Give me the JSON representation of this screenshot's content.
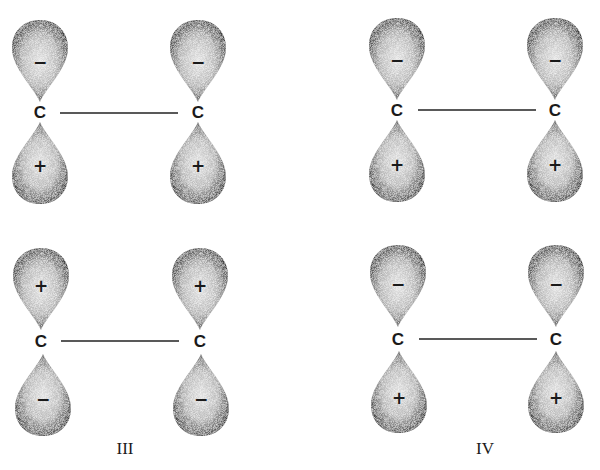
{
  "figure": {
    "title": "",
    "colors": {
      "background": "#ffffff",
      "ink": "#1a1a1a",
      "lobe_fill_edge": "#4a4a4a",
      "lobe_fill_center": "#d8d8d8"
    },
    "diagrams": [
      {
        "id": "I",
        "label": "",
        "atoms": [
          {
            "symbol": "C",
            "upper_lobe_sign": "−",
            "lower_lobe_sign": "+"
          },
          {
            "symbol": "C",
            "upper_lobe_sign": "−",
            "lower_lobe_sign": "+"
          }
        ]
      },
      {
        "id": "II",
        "label": "",
        "atoms": [
          {
            "symbol": "C",
            "upper_lobe_sign": "−",
            "lower_lobe_sign": "+"
          },
          {
            "symbol": "C",
            "upper_lobe_sign": "−",
            "lower_lobe_sign": "+"
          }
        ]
      },
      {
        "id": "III",
        "label": "III",
        "atoms": [
          {
            "symbol": "C",
            "upper_lobe_sign": "+",
            "lower_lobe_sign": "−"
          },
          {
            "symbol": "C",
            "upper_lobe_sign": "+",
            "lower_lobe_sign": "−"
          }
        ]
      },
      {
        "id": "IV",
        "label": "IV",
        "atoms": [
          {
            "symbol": "C",
            "upper_lobe_sign": "−",
            "lower_lobe_sign": "+"
          },
          {
            "symbol": "C",
            "upper_lobe_sign": "−",
            "lower_lobe_sign": "+"
          }
        ]
      }
    ]
  }
}
